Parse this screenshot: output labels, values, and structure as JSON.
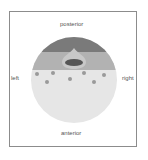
{
  "labels": {
    "posterior": "posterior",
    "anterior": "anterior",
    "left": "left",
    "right": "right"
  },
  "colors": {
    "frame_border": "#8c8c8c",
    "posterior_band": "#7a7a7a",
    "middle_band": "#b2b2b2",
    "anterior_region": "#e6e6e6",
    "teardrop": "#c8c8c8",
    "central_oval": "#555555",
    "dots": "#9a9a9a",
    "label_text": "#555555"
  },
  "diagram": {
    "circle": {
      "cx": 74,
      "cy": 80,
      "r": 43
    },
    "posterior_band_bottom_y": 52,
    "middle_band_bottom_y": 70,
    "dots": [
      {
        "x": 37,
        "y": 74
      },
      {
        "x": 53,
        "y": 73
      },
      {
        "x": 47,
        "y": 82
      },
      {
        "x": 70,
        "y": 79
      },
      {
        "x": 84,
        "y": 73
      },
      {
        "x": 94,
        "y": 82
      },
      {
        "x": 104,
        "y": 75
      }
    ]
  }
}
